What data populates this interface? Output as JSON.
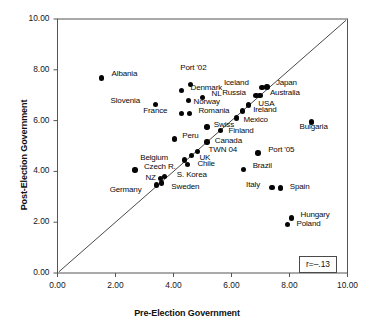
{
  "chart_data": {
    "type": "scatter",
    "title": "",
    "xlabel": "Pre-Election Government",
    "ylabel": "Post-Election Government",
    "xlim": [
      0,
      10
    ],
    "ylim": [
      0,
      10
    ],
    "xticks": [
      "0.00",
      "2.00",
      "4.00",
      "6.00",
      "8.00",
      "10.00"
    ],
    "yticks": [
      "0.00",
      "2.00",
      "4.00",
      "6.00",
      "8.00",
      "10.00"
    ],
    "xtick_values": [
      0,
      2,
      4,
      6,
      8,
      10
    ],
    "ytick_values": [
      0,
      2,
      4,
      6,
      8,
      10
    ],
    "grid": false,
    "legend": "none",
    "annotations": [
      {
        "name": "correlation-box",
        "text": "r=–.13",
        "position": "bottom-right"
      }
    ],
    "reference_line": {
      "name": "identity-line",
      "description": "45-degree y=x diagonal reference line",
      "from": [
        0.05,
        0.05
      ],
      "to": [
        9.95,
        9.95
      ]
    },
    "points": [
      {
        "label": "Albania",
        "x": 1.52,
        "y": 7.68,
        "lx": 10,
        "ly": -4
      },
      {
        "label": "Port '02",
        "x": 4.58,
        "y": 7.42,
        "lx": -10,
        "ly": -17
      },
      {
        "label": "Denmark",
        "x": 4.28,
        "y": 7.18,
        "lx": 9,
        "ly": -3
      },
      {
        "label": "Japan",
        "x": 7.22,
        "y": 7.33,
        "lx": 9,
        "ly": -4
      },
      {
        "label": "Iceland",
        "x": 7.05,
        "y": 7.3,
        "lx": -38,
        "ly": -5
      },
      {
        "label": "Russia",
        "x": 6.85,
        "y": 6.98,
        "lx": -34,
        "ly": -3
      },
      {
        "label": "Australia",
        "x": 6.98,
        "y": 6.98,
        "lx": 10,
        "ly": -3
      },
      {
        "label": "NL",
        "x": 5.0,
        "y": 6.92,
        "lx": 9,
        "ly": -3
      },
      {
        "label": "Slovenia",
        "x": 3.38,
        "y": 6.63,
        "lx": -45,
        "ly": -4
      },
      {
        "label": "Norway",
        "x": 4.52,
        "y": 6.8,
        "lx": 5,
        "ly": 2
      },
      {
        "label": "USA",
        "x": 6.58,
        "y": 6.62,
        "lx": 10,
        "ly": -1
      },
      {
        "label": "Ireland",
        "x": 6.37,
        "y": 6.38,
        "lx": 11,
        "ly": -1
      },
      {
        "label": "France",
        "x": 4.27,
        "y": 6.27,
        "lx": -38,
        "ly": -3
      },
      {
        "label": "Romania",
        "x": 4.55,
        "y": 6.27,
        "lx": 9,
        "ly": -3
      },
      {
        "label": "Mexico",
        "x": 6.17,
        "y": 6.1,
        "lx": 7,
        "ly": 2
      },
      {
        "label": "Bulgaria",
        "x": 8.76,
        "y": 5.95,
        "lx": -12,
        "ly": 5
      },
      {
        "label": "Swiss",
        "x": 5.15,
        "y": 5.75,
        "lx": 7,
        "ly": -2
      },
      {
        "label": "Finland",
        "x": 5.62,
        "y": 5.6,
        "lx": 8,
        "ly": 0
      },
      {
        "label": "Peru",
        "x": 4.03,
        "y": 5.28,
        "lx": 8,
        "ly": -3
      },
      {
        "label": "Canada",
        "x": 5.15,
        "y": 5.15,
        "lx": 8,
        "ly": -1
      },
      {
        "label": "TWN 04",
        "x": 4.83,
        "y": 4.78,
        "lx": 11,
        "ly": -2
      },
      {
        "label": "Port '05",
        "x": 6.92,
        "y": 4.72,
        "lx": 10,
        "ly": -3
      },
      {
        "label": "UK",
        "x": 4.62,
        "y": 4.62,
        "lx": 8,
        "ly": 2
      },
      {
        "label": "Belgium",
        "x": 4.37,
        "y": 4.45,
        "lx": -44,
        "ly": -2
      },
      {
        "label": "Chile",
        "x": 4.48,
        "y": 4.27,
        "lx": 10,
        "ly": -1
      },
      {
        "label": "Brazil",
        "x": 6.42,
        "y": 4.08,
        "lx": 9,
        "ly": -3
      },
      {
        "label": "Czech R.",
        "x": 2.67,
        "y": 4.05,
        "lx": 9,
        "ly": -3
      },
      {
        "label": "S. Korea",
        "x": 3.7,
        "y": 3.8,
        "lx": 12,
        "ly": -1
      },
      {
        "label": "NZ",
        "x": 3.55,
        "y": 3.73,
        "lx": -15,
        "ly": 0
      },
      {
        "label": "Sweden",
        "x": 3.58,
        "y": 3.55,
        "lx": 10,
        "ly": 4
      },
      {
        "label": "Germany",
        "x": 3.42,
        "y": 3.47,
        "lx": -47,
        "ly": 5
      },
      {
        "label": "Italy",
        "x": 7.4,
        "y": 3.37,
        "lx": -26,
        "ly": -2
      },
      {
        "label": "Spain",
        "x": 7.7,
        "y": 3.35,
        "lx": 9,
        "ly": -1
      },
      {
        "label": "Hungary",
        "x": 8.07,
        "y": 2.17,
        "lx": 9,
        "ly": -3
      },
      {
        "label": "Poland",
        "x": 7.93,
        "y": 1.9,
        "lx": 9,
        "ly": -1
      }
    ]
  }
}
